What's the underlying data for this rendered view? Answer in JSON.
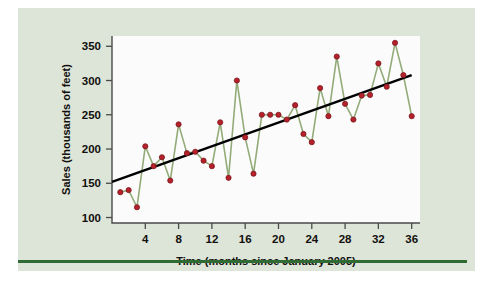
{
  "figure": {
    "background_color": "#dde4d8",
    "plot_background_color": "#fbfbfb",
    "rule_color": "#2f6b33",
    "marker_color": "#b5202a",
    "marker_edge_color": "#7b1a1f",
    "line_color": "#93ab79",
    "trend_color": "#000000",
    "axis_color": "#4a4a4a"
  },
  "chart_data": {
    "type": "line",
    "title": "",
    "subtitle": "",
    "xlabel": "Time (months since January 2005)",
    "ylabel": "Sales (thousands of feet)",
    "xlim": [
      0,
      37
    ],
    "ylim": [
      92,
      365
    ],
    "xticks": [
      4,
      8,
      12,
      16,
      20,
      24,
      28,
      32,
      36
    ],
    "xtick_labels": [
      "4",
      "8",
      "12",
      "16",
      "20",
      "24",
      "28",
      "32",
      "36"
    ],
    "yticks": [
      100,
      150,
      200,
      250,
      300,
      350
    ],
    "ytick_labels": [
      "100",
      "150",
      "200",
      "250",
      "300",
      "350"
    ],
    "grid": false,
    "legend": false,
    "legend_position": "none",
    "x": [
      1,
      2,
      3,
      4,
      5,
      6,
      7,
      8,
      9,
      10,
      11,
      12,
      13,
      14,
      15,
      16,
      17,
      18,
      19,
      20,
      21,
      22,
      23,
      24,
      25,
      26,
      27,
      28,
      29,
      30,
      31,
      32,
      33,
      34,
      35,
      36
    ],
    "series": [
      {
        "name": "Sales",
        "marker": "circle",
        "values": [
          137,
          140,
          115,
          204,
          175,
          188,
          154,
          236,
          194,
          196,
          183,
          175,
          239,
          158,
          300,
          217,
          164,
          250,
          250,
          250,
          243,
          264,
          222,
          210,
          289,
          248,
          335,
          266,
          243,
          278,
          279,
          325,
          291,
          355,
          308,
          248
        ]
      },
      {
        "name": "Trend line",
        "marker": "none",
        "x_endpoints": [
          0,
          36
        ],
        "y_endpoints": [
          152,
          308
        ]
      }
    ],
    "annotations": []
  }
}
